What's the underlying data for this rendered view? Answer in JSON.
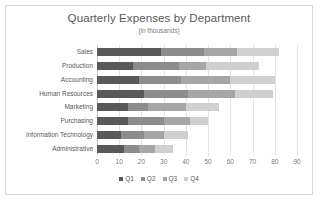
{
  "chart_data": {
    "type": "bar",
    "orientation": "horizontal",
    "stacked": true,
    "title": "Quarterly Expenses by Department",
    "subtitle": "(in thousands)",
    "xlabel": "",
    "ylabel": "",
    "xlim": [
      0,
      90
    ],
    "xticks": [
      0,
      10,
      20,
      30,
      40,
      50,
      60,
      70,
      80,
      90
    ],
    "grid": true,
    "legend_position": "bottom",
    "categories": [
      "Sales",
      "Production",
      "Accounting",
      "Human Resources",
      "Marketing",
      "Purchasing",
      "Information Technology",
      "Administrative"
    ],
    "series": [
      {
        "name": "Q1",
        "color": "#595959",
        "values": [
          29,
          16,
          19,
          21,
          14,
          14,
          11,
          12
        ]
      },
      {
        "name": "Q2",
        "color": "#8c8c8c",
        "values": [
          19,
          21,
          19,
          20,
          9,
          16,
          10,
          7
        ]
      },
      {
        "name": "Q3",
        "color": "#a6a6a6",
        "values": [
          15,
          12,
          22,
          21,
          17,
          12,
          9,
          7
        ]
      },
      {
        "name": "Q4",
        "color": "#d0d0d0",
        "values": [
          19,
          24,
          20,
          17,
          15,
          8,
          11,
          8
        ]
      }
    ],
    "totals": [
      82,
      73,
      80,
      79,
      55,
      50,
      41,
      34
    ]
  },
  "colors": {
    "frame": "#d9d9d9",
    "gridline": "#e4e4e4",
    "axis": "#c9c9c9",
    "text": "#595959",
    "muted_text": "#7a7a7a",
    "background": "#ffffff"
  }
}
